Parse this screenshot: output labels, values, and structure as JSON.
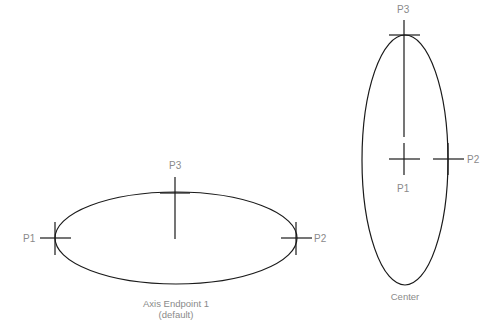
{
  "colors": {
    "stroke": "#1a1a1a",
    "label": "#8a8a8a",
    "background": "#ffffff"
  },
  "diagrams": [
    {
      "method": "Axis Endpoint 1",
      "method_note": "(default)",
      "points": {
        "p1": "P1",
        "p2": "P2",
        "p3": "P3"
      }
    },
    {
      "method": "Center",
      "points": {
        "p1": "P1",
        "p2": "P2",
        "p3": "P3"
      }
    }
  ]
}
